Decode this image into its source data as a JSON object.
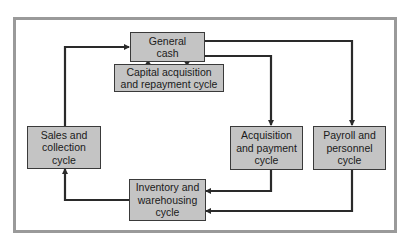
{
  "diagram": {
    "type": "flowchart",
    "colors": {
      "box_fill": "#c4c4c4",
      "box_border": "#3a3a3a",
      "arrow": "#2a2a2a",
      "frame": "#9a9a9a"
    },
    "nodes": {
      "general_cash": "General\ncash",
      "capital": "Capital acquisition\nand repayment cycle",
      "sales": "Sales and\ncollection\ncycle",
      "acquisition": "Acquisition\nand payment\ncycle",
      "payroll": "Payroll and\npersonnel\ncycle",
      "inventory": "Inventory and\nwarehousing\ncycle"
    },
    "edges": [
      {
        "from": "Sales and collection cycle",
        "to": "General cash"
      },
      {
        "from": "General cash",
        "to": "Capital acquisition and repayment cycle"
      },
      {
        "from": "Capital acquisition and repayment cycle",
        "to": "General cash"
      },
      {
        "from": "General cash",
        "to": "Acquisition and payment cycle"
      },
      {
        "from": "General cash",
        "to": "Payroll and personnel cycle"
      },
      {
        "from": "Acquisition and payment cycle",
        "to": "Inventory and warehousing cycle"
      },
      {
        "from": "Payroll and personnel cycle",
        "to": "Inventory and warehousing cycle"
      },
      {
        "from": "Inventory and warehousing cycle",
        "to": "Sales and collection cycle"
      }
    ]
  }
}
